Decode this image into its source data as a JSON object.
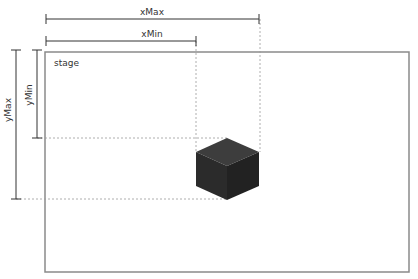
{
  "diagram": {
    "title": "stage",
    "stage": {
      "label": "stage",
      "x": 45,
      "y": 52,
      "width": 364,
      "height": 220,
      "stroke": "#888888"
    },
    "rulers": [
      {
        "id": "xMax",
        "label": "xMax",
        "orientation": "horizontal",
        "from": 46,
        "to": 259,
        "at": 19
      },
      {
        "id": "xMin",
        "label": "xMin",
        "orientation": "horizontal",
        "from": 46,
        "to": 196,
        "at": 41
      },
      {
        "id": "yMax",
        "label": "yMax",
        "orientation": "vertical",
        "from": 50,
        "to": 199,
        "at": 16
      },
      {
        "id": "yMin",
        "label": "yMin",
        "orientation": "vertical",
        "from": 50,
        "to": 138,
        "at": 37
      }
    ],
    "guides": {
      "color": "#999999",
      "vertical_x": [
        196,
        260
      ],
      "horizontal_y": [
        138,
        199
      ]
    },
    "object": {
      "type": "isometric-cube",
      "colors": {
        "top": "#3d3d3d",
        "left": "#2a2a2a",
        "right": "#222222"
      }
    }
  }
}
